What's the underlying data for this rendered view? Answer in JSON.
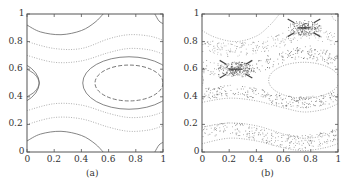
{
  "figure": {
    "panels": [
      {
        "id": "a",
        "caption": "(a)",
        "frame": {
          "x": 27,
          "y": 14,
          "w": 136,
          "h": 138
        }
      },
      {
        "id": "b",
        "caption": "(b)",
        "frame": {
          "x": 202,
          "y": 14,
          "w": 136,
          "h": 138
        }
      }
    ]
  },
  "chart_data": [
    {
      "type": "line",
      "title": "(a)",
      "xlabel": "",
      "ylabel": "",
      "xlim": [
        0,
        1
      ],
      "ylim": [
        0,
        1
      ],
      "x_ticks": [
        "0",
        "0.2",
        "0.4",
        "0.6",
        "0.8",
        "1"
      ],
      "y_ticks": [
        "0",
        "0.2",
        "0.4",
        "0.6",
        "0.8",
        "1"
      ],
      "grid": false,
      "description": "Level curves of a periodic phase portrait: nested closed orbits around an island centered near (0.75, 0.5), wavy invariant curves in bands near y≈0.7–0.8 and y≈0.2–0.3, and separatrix-like arcs near (0.25,0), (0.25,1), (0,0.5), (1,0.5) corners.",
      "series": [
        {
          "name": "island-inner",
          "style": "dashed",
          "color": "#555555",
          "kind": "ellipse",
          "cx": 0.75,
          "cy": 0.5,
          "rx": 0.25,
          "ry": 0.13
        },
        {
          "name": "island-outer",
          "style": "solid",
          "color": "#666666",
          "kind": "ellipse",
          "cx": 0.75,
          "cy": 0.5,
          "rx": 0.34,
          "ry": 0.19
        },
        {
          "name": "top-arc",
          "style": "solid",
          "color": "#666666",
          "points": [
            [
              0,
              0.92
            ],
            [
              0.1,
              0.87
            ],
            [
              0.25,
              0.85
            ],
            [
              0.4,
              0.88
            ],
            [
              0.5,
              0.94
            ],
            [
              0.56,
              1.0
            ]
          ]
        },
        {
          "name": "bottom-arc",
          "style": "solid",
          "color": "#666666",
          "points": [
            [
              0,
              0.08
            ],
            [
              0.1,
              0.13
            ],
            [
              0.25,
              0.15
            ],
            [
              0.4,
              0.12
            ],
            [
              0.5,
              0.06
            ],
            [
              0.56,
              0.0
            ]
          ]
        },
        {
          "name": "band-upper-1",
          "style": "dotted",
          "color": "#9a9a9a",
          "points": [
            [
              0,
              0.8
            ],
            [
              0.2,
              0.75
            ],
            [
              0.4,
              0.75
            ],
            [
              0.6,
              0.82
            ],
            [
              0.75,
              0.85
            ],
            [
              0.9,
              0.84
            ],
            [
              1,
              0.81
            ]
          ]
        },
        {
          "name": "band-upper-2",
          "style": "dotted",
          "color": "#9a9a9a",
          "points": [
            [
              0,
              0.7
            ],
            [
              0.2,
              0.65
            ],
            [
              0.4,
              0.66
            ],
            [
              0.6,
              0.72
            ],
            [
              0.75,
              0.75
            ],
            [
              0.9,
              0.74
            ],
            [
              1,
              0.71
            ]
          ]
        },
        {
          "name": "band-lower-1",
          "style": "dotted",
          "color": "#9a9a9a",
          "points": [
            [
              0,
              0.3
            ],
            [
              0.2,
              0.35
            ],
            [
              0.4,
              0.34
            ],
            [
              0.6,
              0.28
            ],
            [
              0.75,
              0.25
            ],
            [
              0.9,
              0.26
            ],
            [
              1,
              0.29
            ]
          ]
        },
        {
          "name": "band-lower-2",
          "style": "dotted",
          "color": "#9a9a9a",
          "points": [
            [
              0,
              0.2
            ],
            [
              0.2,
              0.25
            ],
            [
              0.4,
              0.24
            ],
            [
              0.6,
              0.18
            ],
            [
              0.75,
              0.15
            ],
            [
              0.9,
              0.16
            ],
            [
              1,
              0.19
            ]
          ]
        },
        {
          "name": "left-lobe",
          "style": "solid",
          "color": "#666666",
          "points": [
            [
              0,
              0.6
            ],
            [
              0.06,
              0.56
            ],
            [
              0.09,
              0.5
            ],
            [
              0.06,
              0.44
            ],
            [
              0,
              0.4
            ]
          ]
        },
        {
          "name": "corner-top-right",
          "style": "solid",
          "color": "#666666",
          "points": [
            [
              0.94,
              1.0
            ],
            [
              0.97,
              0.95
            ],
            [
              1,
              0.93
            ]
          ]
        },
        {
          "name": "corner-bottom-right",
          "style": "solid",
          "color": "#666666",
          "points": [
            [
              0.94,
              0.0
            ],
            [
              0.97,
              0.05
            ],
            [
              1,
              0.07
            ]
          ]
        }
      ]
    },
    {
      "type": "scatter",
      "title": "(b)",
      "xlabel": "",
      "ylabel": "",
      "xlim": [
        0,
        1
      ],
      "ylim": [
        0,
        1
      ],
      "x_ticks": [
        "0",
        "0.2",
        "0.4",
        "0.6",
        "0.8",
        "1"
      ],
      "y_ticks": [
        "0",
        "0.2",
        "0.4",
        "0.6",
        "0.8",
        "1"
      ],
      "grid": false,
      "description": "Poincaré-section style scatter: regular closed orbit around (0.75,0.5), chaotic layers near separatrices at y≈0.4, y≈0.6, y≈0.9 and y≈0.15, with dense clusters near hyperbolic points (0.25,0.6) and (0.75,0.9).",
      "series": [
        {
          "name": "island-orbit",
          "style": "dotted",
          "color": "#888888",
          "kind": "ellipse",
          "cx": 0.75,
          "cy": 0.52,
          "rx": 0.26,
          "ry": 0.13
        },
        {
          "name": "top-regular",
          "style": "dotted",
          "color": "#999999",
          "points": [
            [
              0,
              0.88
            ],
            [
              0.1,
              0.83
            ],
            [
              0.25,
              0.8
            ],
            [
              0.4,
              0.84
            ],
            [
              0.5,
              0.92
            ],
            [
              0.57,
              1.0
            ]
          ]
        },
        {
          "name": "top-right-regular",
          "style": "dotted",
          "color": "#999999",
          "points": [
            [
              0.95,
              1.0
            ],
            [
              0.97,
              0.96
            ],
            [
              1,
              0.95
            ]
          ]
        },
        {
          "name": "chaos-band-upper",
          "style": "scatter",
          "color": "#555555",
          "points": [
            [
              0,
              0.63
            ],
            [
              0.1,
              0.6
            ],
            [
              0.25,
              0.6
            ],
            [
              0.4,
              0.62
            ],
            [
              0.55,
              0.68
            ],
            [
              0.75,
              0.73
            ],
            [
              0.9,
              0.7
            ],
            [
              1,
              0.66
            ]
          ],
          "spread": 0.05
        },
        {
          "name": "chaos-band-mid-upper",
          "style": "scatter",
          "color": "#888888",
          "points": [
            [
              0,
              0.78
            ],
            [
              0.2,
              0.74
            ],
            [
              0.4,
              0.76
            ],
            [
              0.6,
              0.82
            ],
            [
              0.75,
              0.88
            ],
            [
              0.9,
              0.85
            ],
            [
              1,
              0.8
            ]
          ],
          "spread": 0.05
        },
        {
          "name": "chaos-band-mid",
          "style": "scatter",
          "color": "#555555",
          "points": [
            [
              0,
              0.42
            ],
            [
              0.2,
              0.45
            ],
            [
              0.4,
              0.43
            ],
            [
              0.55,
              0.38
            ],
            [
              0.75,
              0.36
            ],
            [
              0.9,
              0.38
            ],
            [
              1,
              0.41
            ]
          ],
          "spread": 0.04
        },
        {
          "name": "regular-mid-lower",
          "style": "dotted",
          "color": "#999999",
          "points": [
            [
              0,
              0.36
            ],
            [
              0.2,
              0.39
            ],
            [
              0.4,
              0.37
            ],
            [
              0.6,
              0.32
            ],
            [
              0.75,
              0.29
            ],
            [
              0.9,
              0.31
            ],
            [
              1,
              0.35
            ]
          ]
        },
        {
          "name": "chaos-band-lower",
          "style": "scatter",
          "color": "#666666",
          "points": [
            [
              0,
              0.14
            ],
            [
              0.15,
              0.17
            ],
            [
              0.3,
              0.16
            ],
            [
              0.5,
              0.1
            ],
            [
              0.7,
              0.07
            ],
            [
              0.85,
              0.09
            ],
            [
              1,
              0.13
            ]
          ],
          "spread": 0.05
        },
        {
          "name": "lower-regular-1",
          "style": "dotted",
          "color": "#999999",
          "points": [
            [
              0,
              0.18
            ],
            [
              0.2,
              0.21
            ],
            [
              0.4,
              0.19
            ],
            [
              0.6,
              0.13
            ],
            [
              0.75,
              0.1
            ],
            [
              0.9,
              0.12
            ],
            [
              1,
              0.17
            ]
          ]
        },
        {
          "name": "lower-regular-2",
          "style": "dotted",
          "color": "#999999",
          "points": [
            [
              0,
              0.06
            ],
            [
              0.2,
              0.1
            ],
            [
              0.4,
              0.08
            ],
            [
              0.6,
              0.03
            ],
            [
              0.75,
              0.01
            ],
            [
              0.9,
              0.03
            ],
            [
              1,
              0.06
            ]
          ]
        },
        {
          "name": "cluster-hyperbolic-1",
          "style": "cluster",
          "color": "#444444",
          "cx": 0.25,
          "cy": 0.6,
          "r": 0.08
        },
        {
          "name": "cluster-hyperbolic-2",
          "style": "cluster",
          "color": "#444444",
          "cx": 0.75,
          "cy": 0.9,
          "r": 0.08
        }
      ]
    }
  ]
}
